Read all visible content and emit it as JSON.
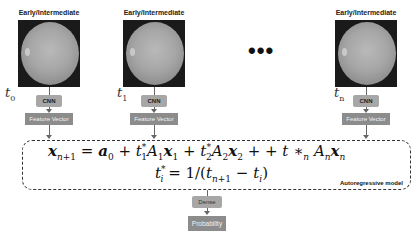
{
  "stages": [
    {
      "label": "Early/Intermediate",
      "time": "t",
      "time_sub": "0",
      "cnn": "CNN",
      "feature": "Feature Vector"
    },
    {
      "label": "Early/Intermediate",
      "time": "t",
      "time_sub": "1",
      "cnn": "CNN",
      "feature": "Feature Vector"
    },
    {
      "label": "Early/Intermediate",
      "time": "t",
      "time_sub": "n",
      "cnn": "CNN",
      "feature": "Feature Vector"
    }
  ],
  "ellipsis": "•••",
  "model": {
    "equation_1": "x_{n+1} = a_0 + t*_1 A_1 x_1 + t*_2 A_2 x_2 + + t *_n A_n x_n",
    "equation_2": "t*_i = 1/(t_{n+1} - t_i)",
    "label": "Autoregressive model"
  },
  "dense": "Dense",
  "output": "Probability",
  "colors": {
    "cnn_box": "#a7a7a7",
    "feature_box": "#8c8c8c",
    "border": "#333333"
  }
}
